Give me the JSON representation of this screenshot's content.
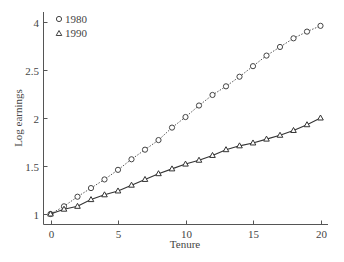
{
  "chart_data": {
    "type": "line",
    "title": "",
    "xlabel": "Tenure",
    "ylabel": "Log earnings",
    "x": [
      0,
      1,
      2,
      3,
      4,
      5,
      6,
      7,
      8,
      9,
      10,
      11,
      12,
      13,
      14,
      15,
      16,
      17,
      18,
      19,
      20
    ],
    "xlim": [
      0,
      20
    ],
    "ylim": [
      1,
      3
    ],
    "x_ticks": [
      0,
      5,
      10,
      15,
      20
    ],
    "x_tick_labels": [
      "0",
      "5",
      "10",
      "15",
      "20"
    ],
    "y_ticks": [
      1,
      1.5,
      2,
      2.5,
      3
    ],
    "y_tick_labels": [
      "1",
      "1.5",
      "2",
      "2.5",
      "4"
    ],
    "grid": false,
    "legend_position": "upper-left",
    "series": [
      {
        "name": "1980",
        "marker": "circle",
        "line_style": "dotted",
        "values": [
          1.0,
          1.08,
          1.18,
          1.27,
          1.36,
          1.46,
          1.57,
          1.67,
          1.77,
          1.9,
          2.01,
          2.13,
          2.24,
          2.33,
          2.43,
          2.54,
          2.65,
          2.74,
          2.83,
          2.9,
          2.96
        ]
      },
      {
        "name": "1990",
        "marker": "triangle",
        "line_style": "solid",
        "values": [
          1.0,
          1.05,
          1.08,
          1.15,
          1.2,
          1.24,
          1.3,
          1.36,
          1.42,
          1.47,
          1.52,
          1.56,
          1.61,
          1.67,
          1.71,
          1.74,
          1.78,
          1.82,
          1.87,
          1.93,
          2.0
        ]
      }
    ]
  },
  "colors": {
    "axis": "#555555",
    "series_1980": "#444444",
    "series_1990": "#333333",
    "text": "#444444"
  }
}
